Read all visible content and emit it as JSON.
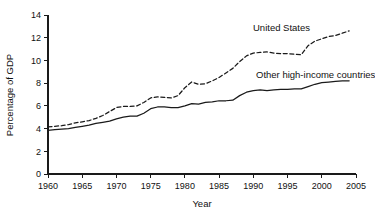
{
  "chart_data": {
    "type": "line",
    "title": "",
    "subtitle": "",
    "xlabel": "Year",
    "ylabel": "Percentage of GDP",
    "xlim": [
      1960,
      2005
    ],
    "ylim": [
      0,
      14
    ],
    "grid": false,
    "legend_position": "inline-annotation",
    "xticks": [
      1960,
      1965,
      1970,
      1975,
      1980,
      1985,
      1990,
      1995,
      2000,
      2005
    ],
    "xtick_labels": [
      "1960",
      "1965",
      "1970",
      "1975",
      "1980",
      "1985",
      "1990",
      "1995",
      "2000",
      "2005"
    ],
    "yticks": [
      0,
      2,
      4,
      6,
      8,
      10,
      12,
      14
    ],
    "ytick_labels": [
      "0",
      "2",
      "4",
      "6",
      "8",
      "10",
      "12",
      "14"
    ],
    "x": [
      1960,
      1961,
      1962,
      1963,
      1964,
      1965,
      1966,
      1967,
      1968,
      1969,
      1970,
      1971,
      1972,
      1973,
      1974,
      1975,
      1976,
      1977,
      1978,
      1979,
      1980,
      1981,
      1982,
      1983,
      1984,
      1985,
      1986,
      1987,
      1988,
      1989,
      1990,
      1991,
      1992,
      1993,
      1994,
      1995,
      1996,
      1997,
      1998,
      1999,
      2000,
      2001,
      2002,
      2003,
      2004
    ],
    "series": [
      {
        "name": "United States",
        "style": "dashed",
        "color": "#1a1a1a",
        "annotation": "United States",
        "values": [
          4.15,
          4.2,
          4.25,
          4.35,
          4.5,
          4.6,
          4.7,
          4.9,
          5.15,
          5.5,
          5.85,
          5.95,
          5.95,
          6.0,
          6.3,
          6.7,
          6.8,
          6.75,
          6.7,
          6.9,
          7.6,
          8.1,
          7.9,
          7.95,
          8.2,
          8.5,
          8.9,
          9.3,
          9.9,
          10.4,
          10.65,
          10.7,
          10.75,
          10.65,
          10.6,
          10.6,
          10.55,
          10.5,
          11.3,
          11.7,
          11.9,
          12.1,
          12.2,
          12.4,
          12.6
        ]
      },
      {
        "name": "Other high-income countries",
        "style": "solid",
        "color": "#1a1a1a",
        "annotation": "Other high-income countries",
        "values": [
          3.85,
          3.9,
          3.95,
          4.0,
          4.1,
          4.2,
          4.3,
          4.45,
          4.55,
          4.65,
          4.85,
          5.0,
          5.1,
          5.1,
          5.35,
          5.75,
          5.9,
          5.9,
          5.85,
          5.85,
          6.0,
          6.2,
          6.15,
          6.3,
          6.35,
          6.45,
          6.45,
          6.5,
          6.9,
          7.2,
          7.35,
          7.4,
          7.35,
          7.4,
          7.45,
          7.45,
          7.5,
          7.5,
          7.7,
          7.9,
          8.05,
          8.1,
          8.15,
          8.2,
          8.2
        ]
      }
    ]
  },
  "labels": {
    "series_us": "United States",
    "series_other": "Other high-income countries",
    "x_axis_title": "Year",
    "y_axis_title": "Percentage of GDP"
  }
}
